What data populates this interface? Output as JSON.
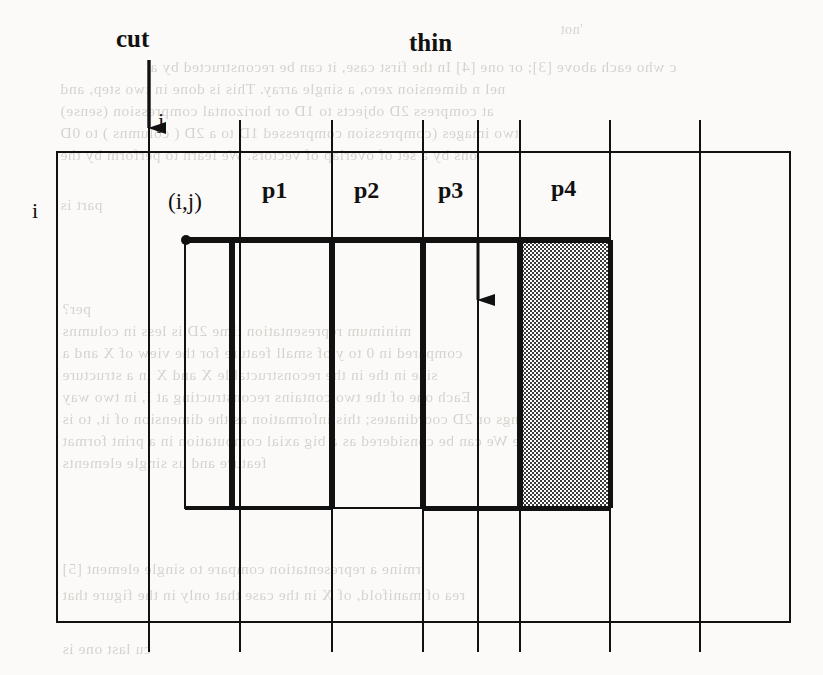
{
  "figure": {
    "labels": {
      "cut": "cut",
      "thin": "thin",
      "row_index": "i",
      "col_index": "j",
      "cell_coord": "(i,j)",
      "partitions": [
        "p1",
        "p2",
        "p3",
        "p4"
      ]
    },
    "colors": {
      "ink": "#111111",
      "paper": "#fbfaf8",
      "ghost_text": "#7e7a72",
      "shade_fill": "#8d8d8d"
    },
    "grid": {
      "left": 57,
      "right": 790,
      "top": 152,
      "bottom": 622,
      "vertical_lines": [
        149,
        240,
        332,
        423,
        478,
        520,
        610,
        700
      ],
      "horizontal_lines": [
        152,
        622
      ]
    },
    "region": {
      "outline_left": 185,
      "outline_right": 610,
      "outline_top": 240,
      "outline_bottom": 508,
      "bold_dividers": [
        232,
        332,
        423,
        520
      ],
      "shaded_column": {
        "left": 520,
        "right": 610,
        "top": 240,
        "bottom": 508
      }
    },
    "arrows": [
      {
        "name": "cut-arrow",
        "x": 149,
        "y_start": 60,
        "y_end": 148
      },
      {
        "name": "thin-arrow",
        "x": 478,
        "y_start": 240,
        "y_end": 325
      }
    ],
    "dot": {
      "name": "origin-dot",
      "x": 185,
      "y": 240
    }
  },
  "ghost_text": {
    "block_top": [
      "'not",
      "c  who  each  above  [3];  or  one  [4]   In  the  first  case,  it  can  be  reconstructed  by  a",
      "nel  n  dimension  zero,   a  single  array.   This  is  done  in  two  step,  and",
      "at  compress  2D  objects  to  1D  or  horizontal  compression  (sense)",
      "two  images  (compression  compressed  1D  to  a  2D  ( columns )  to  0D",
      "ons  by  a  set  of  overlap  of  vectors.   We  learn  to  perform  by  the",
      "part is"
    ],
    "block_mid": [
      "per?",
      "minimum  representation  time  2D  is  less  in  columns",
      "compared  in  0  to  y  of  small  feature  for  the  view  of  X  and  a",
      "size  in  the  in  the  reconstructable  X  and  X  in  a  structure",
      "Each  one  of  the  two  contains  reconstructing  at  I,  in  two  way",
      "ings  or  2D  coordinates;  this  information  as  the  dimension  of  it,  to  is",
      "he  balance  We  can  be  considered  as  a  big  axial  computation  in  a  print  format",
      "feature  and  us  single  elements"
    ],
    "block_bot": [
      "rmine  a  representation  compare  to  single  element  [5]",
      "rea  of  manifold,  of  X  in  the  case  that  only  in  the  figure  that",
      "cu  last  one  is"
    ]
  }
}
